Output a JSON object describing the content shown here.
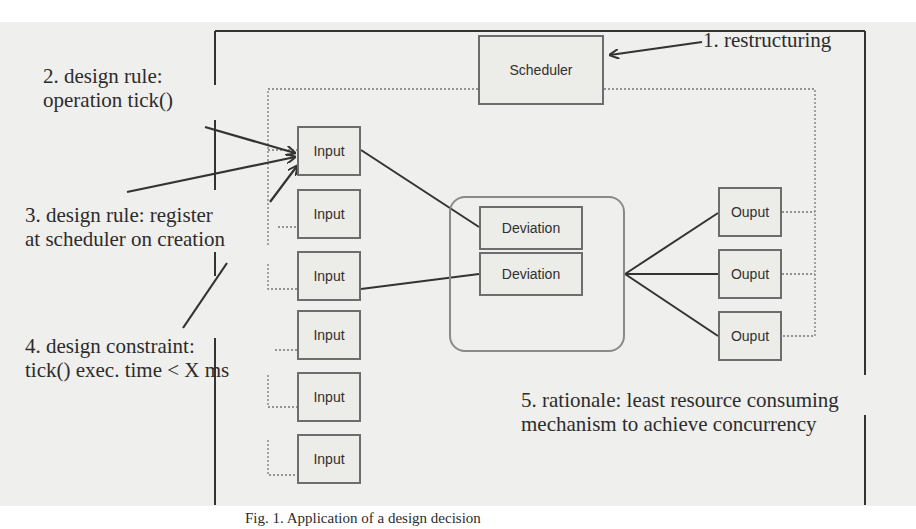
{
  "diagram": {
    "components": {
      "scheduler": "Scheduler",
      "inputs": [
        "Input",
        "Input",
        "Input",
        "Input",
        "Input",
        "Input"
      ],
      "deviations": [
        "Deviation",
        "Deviation"
      ],
      "outputs": [
        "Ouput",
        "Ouput",
        "Ouput"
      ]
    },
    "annotations": {
      "restructuring": "1. restructuring",
      "design_rule_tick_line1": "2. design rule:",
      "design_rule_tick_line2": "operation tick()",
      "design_rule_register_line1": "3. design rule: register",
      "design_rule_register_line2": "at scheduler on creation",
      "design_constraint_line1": "4. design constraint:",
      "design_constraint_line2": "tick() exec. time < X ms",
      "rationale_line1": "5. rationale: least resource consuming",
      "rationale_line2": "mechanism to achieve concurrency"
    },
    "caption": "Fig. 1. Application of a design decision"
  },
  "colors": {
    "scan_background": "#efefed",
    "box_border": "#6d6d6d",
    "text": "#2c2c2c"
  }
}
